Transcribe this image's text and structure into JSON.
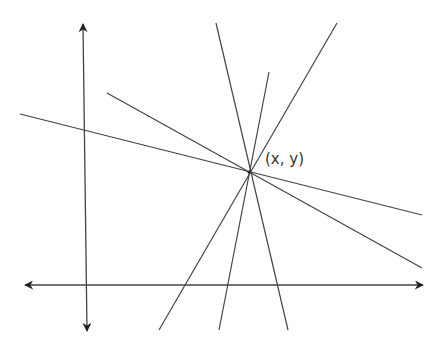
{
  "diagram": {
    "title": "",
    "point_label": "(x, y)",
    "stroke_color": "#444444",
    "background": "#ffffff",
    "intersection_point": {
      "x": 249,
      "y": 172
    },
    "axes": {
      "x_axis": {
        "x1": 25,
        "y1": 285,
        "x2": 423,
        "y2": 285,
        "arrows": "both"
      },
      "y_axis": {
        "x1": 83,
        "y1": 24,
        "x2": 87,
        "y2": 331,
        "arrows": "both"
      }
    },
    "lines": [
      {
        "id": "line-1",
        "x1": 20,
        "y1": 114,
        "x2": 422,
        "y2": 215
      },
      {
        "id": "line-2",
        "x1": 107,
        "y1": 93,
        "x2": 422,
        "y2": 268
      },
      {
        "id": "line-3",
        "x1": 216,
        "y1": 23,
        "x2": 288,
        "y2": 330
      },
      {
        "id": "line-4",
        "x1": 269,
        "y1": 72,
        "x2": 219,
        "y2": 330
      },
      {
        "id": "line-5",
        "x1": 337,
        "y1": 23,
        "x2": 159,
        "y2": 330
      }
    ],
    "caption": "Several lines passing through a common point (x, y) on a coordinate plane"
  }
}
